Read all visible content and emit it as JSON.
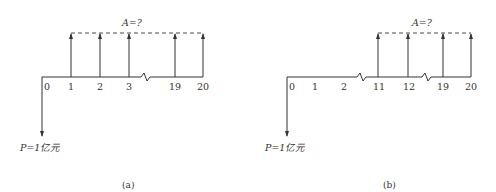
{
  "panels": [
    {
      "id": "a",
      "caption": "(a)",
      "annuity_label": "A=?",
      "present_label": "P=1亿元",
      "ticks": [
        "0",
        "1",
        "2",
        "3",
        "19",
        "20"
      ],
      "arrow_periods": [
        "1",
        "2",
        "3",
        "19",
        "20"
      ],
      "breaks_after": [
        "3"
      ]
    },
    {
      "id": "b",
      "caption": "(b)",
      "annuity_label": "A=?",
      "present_label": "P=1亿元",
      "ticks": [
        "0",
        "1",
        "2",
        "11",
        "12",
        "19",
        "20"
      ],
      "arrow_periods": [
        "11",
        "12",
        "19",
        "20"
      ],
      "breaks_after": [
        "2",
        "12"
      ]
    }
  ]
}
